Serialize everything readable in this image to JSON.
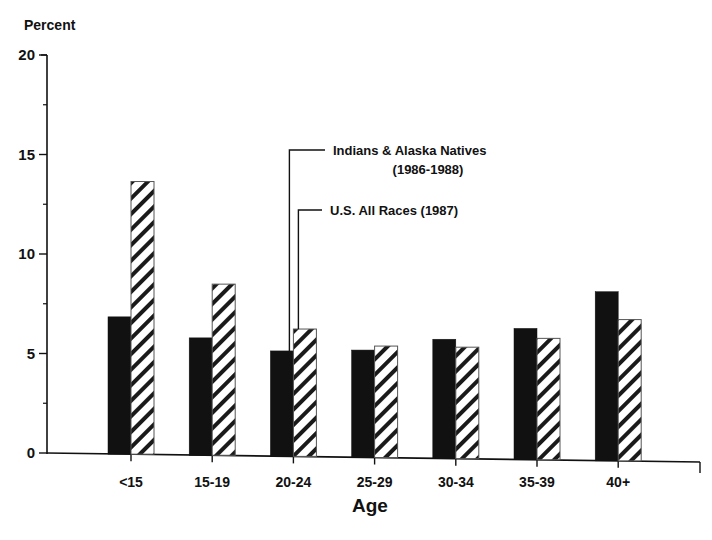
{
  "chart_data": {
    "type": "bar",
    "title": "",
    "xlabel": "Age",
    "ylabel": "Percent",
    "ylim": [
      0,
      20
    ],
    "yticks": [
      0,
      5,
      10,
      15,
      20
    ],
    "yticks_minor": [
      2.5,
      7.5,
      12.5,
      17.5
    ],
    "grid": false,
    "categories": [
      "<15",
      "15-19",
      "20-24",
      "25-29",
      "30-34",
      "35-39",
      "40+"
    ],
    "series": [
      {
        "name": "Indians & Alaska Natives (1986-1988)",
        "fill": "solid",
        "color": "#111111",
        "values": [
          6.9,
          5.9,
          5.3,
          5.4,
          6.0,
          6.6,
          8.5
        ]
      },
      {
        "name": "U.S. All Races (1987)",
        "fill": "diagonal-hatch",
        "color": "#111111",
        "values": [
          13.7,
          8.6,
          6.4,
          5.6,
          5.6,
          6.1,
          7.1
        ]
      }
    ],
    "annotations": [
      {
        "lines": [
          "Indians & Alaska Natives",
          "(1986-1988)"
        ],
        "points_to_series": 0,
        "category": "20-24"
      },
      {
        "lines": [
          "U.S. All Races (1987)"
        ],
        "points_to_series": 1,
        "category": "20-24"
      }
    ]
  }
}
